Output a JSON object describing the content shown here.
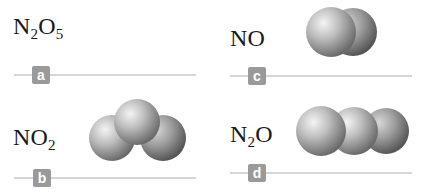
{
  "items": [
    {
      "id": "a",
      "formula_parts": [
        "N",
        "2",
        "O",
        "5"
      ],
      "label": "a",
      "model": "none"
    },
    {
      "id": "b",
      "formula_parts": [
        "NO",
        "2"
      ],
      "label": "b",
      "model": "bent-triatomic"
    },
    {
      "id": "c",
      "formula_parts": [
        "NO"
      ],
      "label": "c",
      "model": "diatomic"
    },
    {
      "id": "d",
      "formula_parts": [
        "N",
        "2",
        "O"
      ],
      "label": "d",
      "model": "linear-triatomic"
    }
  ],
  "colors": {
    "sphere_light": "#f2f2f2",
    "sphere_dark": "#6e6e6e",
    "badge": "#9a9a9a",
    "rule": "#d6d6d6"
  }
}
